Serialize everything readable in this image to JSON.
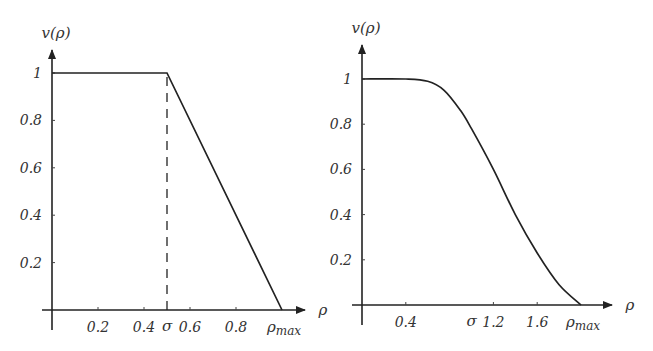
{
  "chart_data": [
    {
      "type": "line",
      "title": "",
      "xlabel": "ρ",
      "ylabel": "v(ρ)",
      "x_ticks": [
        "0.2",
        "0.4",
        "0.6",
        "0.8"
      ],
      "x_tick_values": [
        0.2,
        0.4,
        0.6,
        0.8
      ],
      "special_x_labels": [
        {
          "label": "σ",
          "value": 0.5
        },
        {
          "label": "ρmax",
          "value": 1.0
        }
      ],
      "y_ticks": [
        "0.2",
        "0.4",
        "0.6",
        "0.8",
        "1"
      ],
      "y_tick_values": [
        0.2,
        0.4,
        0.6,
        0.8,
        1.0
      ],
      "xlim": [
        0,
        1.0
      ],
      "ylim": [
        0,
        1.0
      ],
      "grid": false,
      "dashed_vertical_line_at": 0.5,
      "series": [
        {
          "name": "v(ρ) piecewise linear",
          "x": [
            0,
            0.5,
            1.0
          ],
          "values": [
            1,
            1,
            0
          ]
        }
      ]
    },
    {
      "type": "line",
      "title": "",
      "xlabel": "ρ",
      "ylabel": "v(ρ)",
      "x_ticks": [
        "0.4",
        "1.2",
        "1.6"
      ],
      "x_tick_values": [
        0.4,
        1.2,
        1.6
      ],
      "special_x_labels": [
        {
          "label": "σ",
          "value": 1.0
        },
        {
          "label": "ρmax",
          "value": 2.0
        }
      ],
      "y_ticks": [
        "0.2",
        "0.4",
        "0.6",
        "0.8",
        "1"
      ],
      "y_tick_values": [
        0.2,
        0.4,
        0.6,
        0.8,
        1.0
      ],
      "xlim": [
        0,
        2.0
      ],
      "ylim": [
        0,
        1.0
      ],
      "grid": false,
      "series": [
        {
          "name": "v(ρ) smooth",
          "x": [
            0,
            0.4,
            0.6,
            0.75,
            0.9,
            1.0,
            1.2,
            1.4,
            1.6,
            1.8,
            2.0
          ],
          "values": [
            1,
            1,
            0.99,
            0.95,
            0.86,
            0.78,
            0.6,
            0.4,
            0.23,
            0.09,
            0
          ]
        }
      ]
    }
  ],
  "labels": {
    "ylabel": "v(ρ)",
    "xlabel": "ρ",
    "sigma": "σ",
    "rho": "ρ",
    "max": "max"
  }
}
